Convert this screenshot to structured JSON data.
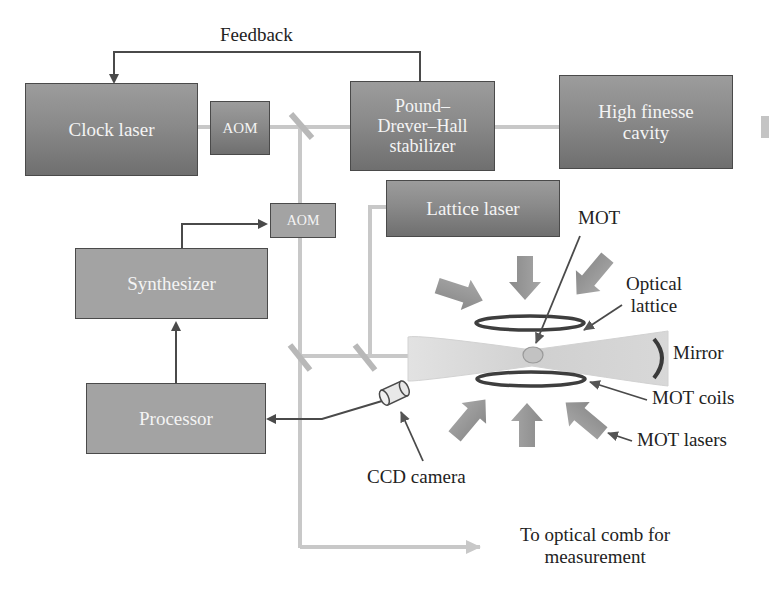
{
  "diagram": {
    "type": "optical lattice clock schematic",
    "colors": {
      "box_dark": "#7f7f7f",
      "box_light": "#a3a3a3",
      "beam": "#c8c8c8",
      "signal_line": "#4a4a4a",
      "text": "#222222",
      "box_text": "#f4f4f4"
    }
  },
  "boxes": {
    "clock_laser": "Clock laser",
    "aom_top": "AOM",
    "pdh_line1": "Pound–",
    "pdh_line2": "Drever–Hall",
    "pdh_line3": "stabilizer",
    "cavity_line1": "High finesse",
    "cavity_line2": "cavity",
    "lattice_laser": "Lattice laser",
    "aom_mid": "AOM",
    "synthesizer": "Synthesizer",
    "processor": "Processor"
  },
  "labels": {
    "feedback": "Feedback",
    "mot": "MOT",
    "optical_lattice_line1": "Optical",
    "optical_lattice_line2": "lattice",
    "mirror": "Mirror",
    "mot_coils": "MOT coils",
    "mot_lasers": "MOT lasers",
    "ccd_camera": "CCD camera",
    "output_line1": "To optical comb for",
    "output_line2": "measurement"
  },
  "connections": [
    {
      "from": "Pound–Drever–Hall stabilizer",
      "to": "Clock laser",
      "label": "Feedback",
      "kind": "signal"
    },
    {
      "from": "Clock laser",
      "to": "AOM",
      "kind": "beam"
    },
    {
      "from": "AOM",
      "to": "Pound–Drever–Hall stabilizer",
      "kind": "beam"
    },
    {
      "from": "Pound–Drever–Hall stabilizer",
      "to": "High finesse cavity",
      "kind": "beam"
    },
    {
      "from": "Synthesizer",
      "to": "AOM (lower)",
      "kind": "signal"
    },
    {
      "from": "Processor",
      "to": "Synthesizer",
      "kind": "signal"
    },
    {
      "from": "CCD camera",
      "to": "Processor",
      "kind": "signal"
    },
    {
      "from": "Lattice laser",
      "to": "Optical lattice",
      "kind": "beam"
    },
    {
      "from": "Clock beam",
      "to": "Optical comb",
      "kind": "beam"
    }
  ]
}
